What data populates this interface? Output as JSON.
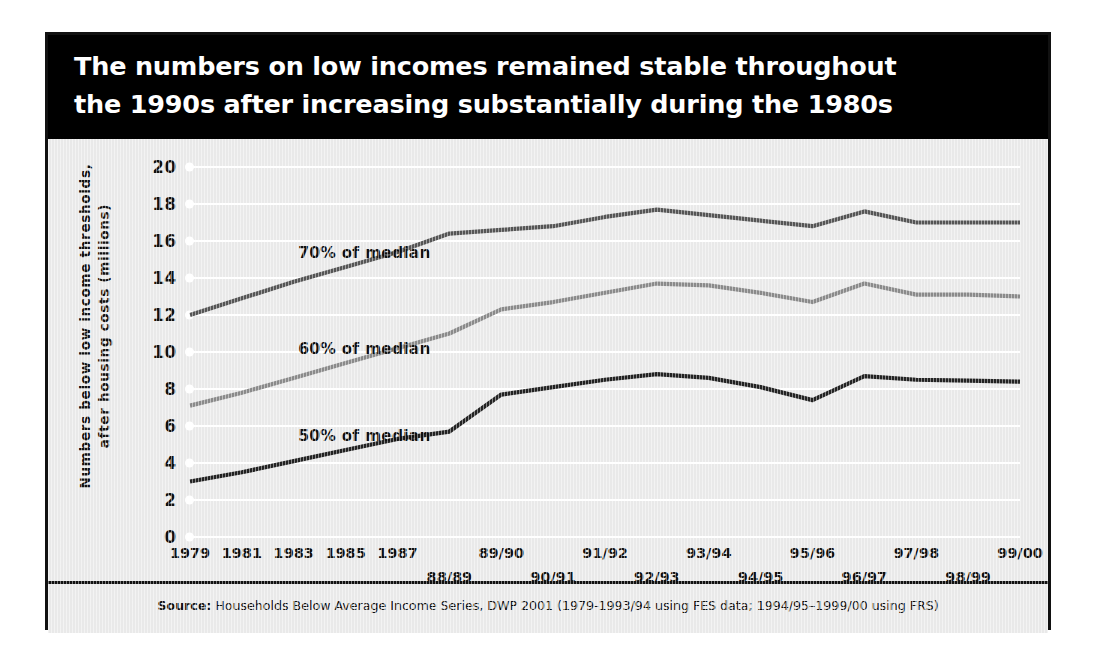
{
  "title": {
    "line1": "The numbers on low incomes remained stable throughout",
    "line2": "the 1990s after increasing substantially during the 1980s"
  },
  "source": {
    "label": "Source:",
    "text": " Households Below Average Income Series, DWP 2001 (1979-1993/94 using FES data; 1994/95–1999/00 using FRS)"
  },
  "colors": {
    "banner_background": "#000000",
    "banner_text": "#ffffff",
    "plot_background": "#e9e9e9",
    "gridline": "#ffffff",
    "series_70": "#555555",
    "series_60": "#8a8a8a",
    "series_50": "#222222",
    "frame": "#111111"
  },
  "chart_data": {
    "type": "line",
    "title": "The numbers on low incomes remained stable throughout the 1990s after increasing substantially during the 1980s",
    "xlabel": "",
    "ylabel": "Numbers below low income thresholds, after housing costs (millions)",
    "ylim": [
      0,
      20
    ],
    "yticks": [
      0,
      2,
      4,
      6,
      8,
      10,
      12,
      14,
      16,
      18,
      20
    ],
    "ytick_labels": [
      "0",
      "2",
      "4",
      "6",
      "8",
      "10",
      "12",
      "14",
      "16",
      "18",
      "20"
    ],
    "grid": "horizontal",
    "legend": "inline-labels",
    "categories": [
      "1979",
      "1981",
      "1983",
      "1985",
      "1987",
      "88/89",
      "89/90",
      "90/91",
      "91/92",
      "92/93",
      "93/94",
      "94/95",
      "95/96",
      "96/97",
      "97/98",
      "98/99",
      "99/00"
    ],
    "x_tick_rows": [
      {
        "row": 0,
        "labels": [
          "1979",
          "1981",
          "1983",
          "1985",
          "1987",
          "89/90",
          "91/92",
          "93/94",
          "95/96",
          "97/98",
          "99/00"
        ]
      },
      {
        "row": 1,
        "labels": [
          "88/89",
          "90/91",
          "92/93",
          "94/95",
          "96/97",
          "98/99"
        ]
      }
    ],
    "series": [
      {
        "name": "70% of median",
        "color": "#555555",
        "label_x": "1985",
        "values": [
          12.0,
          12.9,
          13.8,
          14.6,
          15.4,
          16.4,
          16.6,
          16.8,
          17.3,
          17.7,
          17.4,
          17.1,
          16.8,
          17.6,
          17.0,
          17.0,
          17.0
        ]
      },
      {
        "name": "60% of median",
        "color": "#8a8a8a",
        "label_x": "1985",
        "values": [
          7.1,
          7.8,
          8.6,
          9.4,
          10.2,
          11.0,
          12.3,
          12.7,
          13.2,
          13.7,
          13.6,
          13.2,
          12.7,
          13.7,
          13.1,
          13.1,
          13.0
        ]
      },
      {
        "name": "50% of median",
        "color": "#222222",
        "label_x": "1985",
        "values": [
          3.0,
          3.5,
          4.1,
          4.7,
          5.3,
          5.7,
          7.7,
          8.1,
          8.5,
          8.8,
          8.6,
          8.1,
          7.4,
          8.7,
          8.5,
          8.45,
          8.4
        ]
      }
    ],
    "annotations": [
      {
        "text": "70% of median",
        "series": "70% of median"
      },
      {
        "text": "60% of median",
        "series": "60% of median"
      },
      {
        "text": "50% of median",
        "series": "50% of median"
      }
    ]
  }
}
